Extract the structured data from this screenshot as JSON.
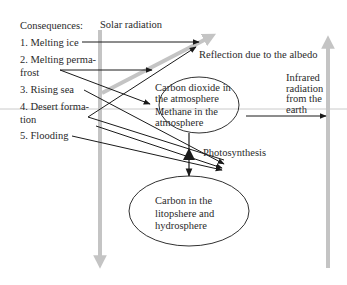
{
  "figure": {
    "consequences": {
      "title": "Consequences:",
      "items": [
        {
          "label_line1": "1. Melting ice",
          "label_line2": ""
        },
        {
          "label_line1": "2. Melting perma-",
          "label_line2": "frost"
        },
        {
          "label_line1": "3. Rising sea",
          "label_line2": ""
        },
        {
          "label_line1": "4. Desert forma-",
          "label_line2": "tion"
        },
        {
          "label_line1": "5. Flooding",
          "label_line2": ""
        }
      ]
    },
    "solar_radiation": "Solar radiation",
    "reflection": "Reflection due to the albedo",
    "infrared": {
      "line1": "Infrared",
      "line2": "radiation",
      "line3": "from the",
      "line4": "earth"
    },
    "atmosphere_ellipse": {
      "line1": "Carbon dioxide in",
      "line2": "the atmosphere",
      "line3": "Methane in the",
      "line4": "atmosphere"
    },
    "photosynthesis": "Photosynthesis",
    "lithosphere_ellipse": {
      "line1": "Carbon in the",
      "line2": "litopshere and",
      "line3": "hydrosphere"
    },
    "colors": {
      "text": "#2a2a2a",
      "line": "#1a1a1a",
      "gray_arrow": "#c4c4c4",
      "guide_line": "#bdbdbd"
    }
  }
}
